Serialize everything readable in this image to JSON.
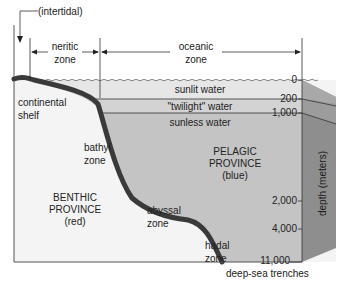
{
  "diagram": {
    "top_labels": {
      "intertidal": "(intertidal)",
      "neritic_line1": "neritic",
      "neritic_line2": "zone",
      "oceanic_line1": "oceanic",
      "oceanic_line2": "zone"
    },
    "water_layers": {
      "sunlit": "sunlit water",
      "twilight": "\"twilight\" water",
      "sunless": "sunless water"
    },
    "benthic_zones": {
      "continental_line1": "continental",
      "continental_line2": "shelf",
      "bathyl_line1": "bathyl",
      "bathyl_line2": "zone",
      "abyssal_line1": "abyssal",
      "abyssal_line2": "zone",
      "hadal_line1": "hadal",
      "hadal_line2": "zone"
    },
    "provinces": {
      "benthic_line1": "BENTHIC",
      "benthic_line2": "PROVINCE",
      "benthic_line3": "(red)",
      "pelagic_line1": "PELAGIC",
      "pelagic_line2": "PROVINCE",
      "pelagic_line3": "(blue)"
    },
    "depth_ticks": [
      "0",
      "200",
      "1,000",
      "2,000",
      "4,000",
      "11,000"
    ],
    "depth_axis_label": "depth (meters)",
    "bottom_label": "deep-sea trenches",
    "colors": {
      "sunlit": "#e4e4e4",
      "twilight": "#d2d2d2",
      "sunless": "#c4c4c4",
      "seafloor": "#3a3a3a",
      "benthic": "#f4f4f4",
      "side_panel": "#8e8e8e"
    }
  }
}
